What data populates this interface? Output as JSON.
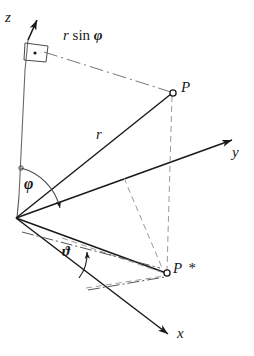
{
  "figure": {
    "domain": "diagram",
    "width": 254,
    "height": 356,
    "background": "#ffffff",
    "ink_color": "#1a1a1a",
    "thin_color": "#555555"
  },
  "labels": {
    "axis_z": "z",
    "axis_y": "y",
    "axis_x": "x",
    "point_p": "P",
    "point_p_star": "P *",
    "radius": "r",
    "angle_phi": "φ",
    "angle_theta": "ϑ",
    "r_sin_phi_prefix": "r",
    "r_sin_phi_func": " sin ",
    "r_sin_phi_angle": "φ"
  },
  "geometry": {
    "origin": {
      "x": 16,
      "y": 218
    },
    "z_axis_tip": {
      "x": 38,
      "y": 14
    },
    "z_axis_foot": {
      "x": 19,
      "y": 196
    },
    "y_axis_tip": {
      "x": 241,
      "y": 136
    },
    "x_axis_tip": {
      "x": 176,
      "y": 339
    },
    "point_p": {
      "x": 172,
      "y": 93
    },
    "point_p_star": {
      "x": 167,
      "y": 273
    },
    "z_foot_of_p": {
      "x": 28,
      "y": 52
    },
    "right_angle_marker_center": {
      "x": 36,
      "y": 53
    }
  },
  "elements": [
    {
      "name": "z-axis",
      "style": "solid-with-arrow"
    },
    {
      "name": "y-axis",
      "style": "solid-with-arrow"
    },
    {
      "name": "x-axis",
      "style": "solid-with-arrow"
    },
    {
      "name": "radius-line-OP",
      "style": "solid"
    },
    {
      "name": "line-O-Pstar",
      "style": "solid"
    },
    {
      "name": "r-sin-phi-line",
      "style": "dash-dot"
    },
    {
      "name": "p-to-pstar-drop",
      "style": "dashed"
    },
    {
      "name": "projection-box",
      "style": "dashed"
    },
    {
      "name": "phi-arc",
      "style": "arc-with-arrow"
    },
    {
      "name": "theta-arc",
      "style": "arc-with-arrow"
    },
    {
      "name": "right-angle-marker",
      "style": "parallelogram-with-dot"
    }
  ]
}
